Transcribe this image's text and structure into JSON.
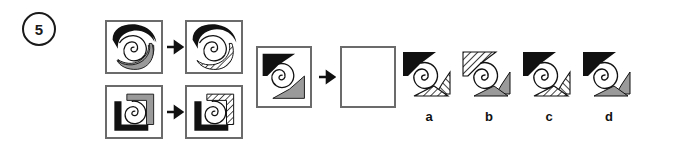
{
  "question": {
    "number": "5",
    "type": "visual-analogy-multiple-choice"
  },
  "colors": {
    "black": "#111111",
    "gray": "#9a9a9a",
    "hatch_line": "#111111",
    "frame": "#6b6b6b",
    "background": "#ffffff",
    "text": "#111111"
  },
  "examples": [
    {
      "name": "example-row-1",
      "left": {
        "label": "spiral-with-black-and-gray-crescents",
        "shapes": [
          {
            "name": "crescent-top-left",
            "fill": "black"
          },
          {
            "name": "crescent-bottom-right",
            "fill": "gray"
          },
          {
            "name": "spiral",
            "fill": "outline"
          }
        ]
      },
      "arrow": "→",
      "right": {
        "label": "spiral-with-black-and-hatched-crescents",
        "shapes": [
          {
            "name": "crescent-top-left",
            "fill": "black"
          },
          {
            "name": "crescent-bottom-right",
            "fill": "hatched"
          },
          {
            "name": "spiral",
            "fill": "outline"
          }
        ]
      }
    },
    {
      "name": "example-row-2",
      "left": {
        "label": "spiral-with-black-and-gray-L-shapes",
        "shapes": [
          {
            "name": "L-shape-bottom-left",
            "fill": "black"
          },
          {
            "name": "L-shape-top-right",
            "fill": "gray"
          },
          {
            "name": "spiral",
            "fill": "outline"
          }
        ]
      },
      "arrow": "→",
      "right": {
        "label": "spiral-with-black-and-hatched-L-shapes",
        "shapes": [
          {
            "name": "L-shape-bottom-left",
            "fill": "black"
          },
          {
            "name": "L-shape-top-right",
            "fill": "hatched"
          },
          {
            "name": "spiral",
            "fill": "outline"
          }
        ]
      }
    }
  ],
  "prompt": {
    "name": "question-row",
    "source": {
      "label": "spiral-with-black-triangle-and-gray-wedge",
      "shapes": [
        {
          "name": "triangle-top-left",
          "fill": "black"
        },
        {
          "name": "wedge-bottom-right",
          "fill": "gray"
        },
        {
          "name": "spiral",
          "fill": "outline"
        }
      ]
    },
    "arrow": "→",
    "answer_box": {
      "label": "empty-answer-box",
      "content": ""
    }
  },
  "options": [
    {
      "letter": "a",
      "shapes": [
        {
          "name": "triangle-top-left",
          "fill": "black"
        },
        {
          "name": "wedge-right",
          "fill": "hatched"
        },
        {
          "name": "triangle-bottom",
          "fill": "hatched"
        },
        {
          "name": "spiral",
          "fill": "outline"
        }
      ]
    },
    {
      "letter": "b",
      "shapes": [
        {
          "name": "triangle-top-left",
          "fill": "hatched"
        },
        {
          "name": "wedge-right",
          "fill": "gray"
        },
        {
          "name": "triangle-bottom",
          "fill": "gray"
        },
        {
          "name": "spiral",
          "fill": "outline"
        }
      ]
    },
    {
      "letter": "c",
      "shapes": [
        {
          "name": "triangle-top-left",
          "fill": "black"
        },
        {
          "name": "wedge-right",
          "fill": "hatched"
        },
        {
          "name": "triangle-bottom",
          "fill": "hatched"
        },
        {
          "name": "spiral",
          "fill": "outline"
        }
      ]
    },
    {
      "letter": "d",
      "shapes": [
        {
          "name": "triangle-top-left",
          "fill": "black"
        },
        {
          "name": "wedge-right",
          "fill": "gray"
        },
        {
          "name": "triangle-bottom",
          "fill": "gray"
        },
        {
          "name": "spiral",
          "fill": "outline"
        }
      ]
    }
  ]
}
